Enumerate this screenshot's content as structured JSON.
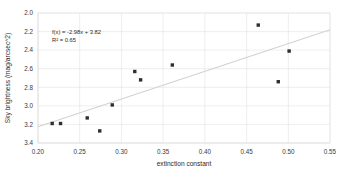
{
  "chart_data": {
    "type": "scatter",
    "title": "",
    "xlabel": "extinction constant",
    "ylabel": "Sky brightness (mag/arcsec^2)",
    "xlim": [
      0.2,
      0.55
    ],
    "ylim": [
      3.4,
      2.0
    ],
    "y_axis_inverted": true,
    "grid": true,
    "legend": "none",
    "xticks": [
      0.2,
      0.25,
      0.3,
      0.35,
      0.4,
      0.45,
      0.5,
      0.55
    ],
    "xtick_labels": [
      "0.20",
      "0.25",
      "0.30",
      "0.35",
      "0.40",
      "0.45",
      "0.50",
      "0.55"
    ],
    "yticks": [
      2.0,
      2.2,
      2.4,
      2.6,
      2.8,
      3.0,
      3.2,
      3.4
    ],
    "ytick_labels": [
      "2.0",
      "2.2",
      "2.4",
      "2.6",
      "2.8",
      "3.0",
      "3.2",
      "3.4"
    ],
    "points": [
      {
        "x": 0.217,
        "y": 3.19
      },
      {
        "x": 0.227,
        "y": 3.19
      },
      {
        "x": 0.259,
        "y": 3.13
      },
      {
        "x": 0.274,
        "y": 3.27
      },
      {
        "x": 0.289,
        "y": 2.99
      },
      {
        "x": 0.316,
        "y": 2.63
      },
      {
        "x": 0.323,
        "y": 2.72
      },
      {
        "x": 0.361,
        "y": 2.56
      },
      {
        "x": 0.464,
        "y": 2.13
      },
      {
        "x": 0.488,
        "y": 2.74
      },
      {
        "x": 0.501,
        "y": 2.41
      }
    ],
    "marker_style": "square",
    "marker_size": 3.4,
    "marker_color": "#2e2e2e",
    "trendline": {
      "slope": -2.98,
      "intercept": 3.82,
      "color": "#d2d2d2",
      "x_start": 0.2,
      "x_end": 0.55
    },
    "annotations": {
      "equation": "f(x) = -2.98x + 3.82",
      "r_squared": "R² = 0.65"
    }
  },
  "colors": {
    "grid": "#e2e2e2",
    "axis": "#c9c9c9",
    "text": "#2b2b2b",
    "tick_text": "#3a3a3a",
    "marker": "#2e2e2e",
    "trend": "#d2d2d2",
    "background": "#ffffff"
  }
}
